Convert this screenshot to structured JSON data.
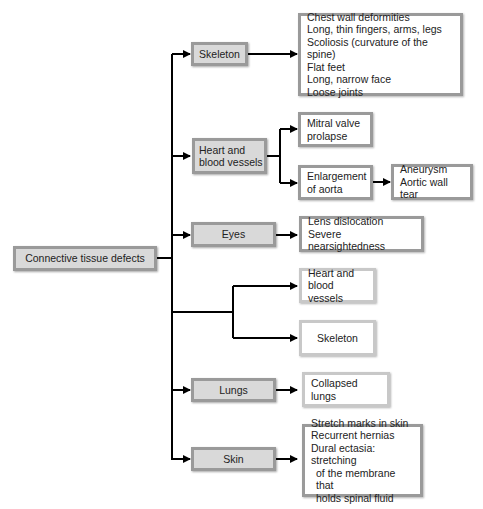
{
  "root": {
    "label": "Connective tissue defects"
  },
  "categories": [
    {
      "label": "Skeleton",
      "details": [
        "Chest wall deformities",
        "Long, thin fingers, arms, legs",
        "Scoliosis (curvature of the spine)",
        "Flat feet",
        "Long, narrow face",
        "Loose joints"
      ]
    },
    {
      "label": "Heart and blood vessels",
      "line1": "Heart and",
      "line2": "blood vessels",
      "sub": [
        {
          "line1": "Mitral valve",
          "line2": "prolapse"
        },
        {
          "line1": "Enlargement",
          "line2": "of aorta",
          "result": [
            "Aneurysm",
            "Aortic wall tear"
          ]
        }
      ]
    },
    {
      "label": "Eyes",
      "details": [
        "Lens dislocation",
        "Severe nearsightedness"
      ]
    },
    {
      "label": "",
      "targets": [
        {
          "line1": "Heart and",
          "line2": "blood vessels"
        },
        {
          "label": "Skeleton"
        }
      ]
    },
    {
      "label": "Lungs",
      "details": [
        "Collapsed lungs"
      ]
    },
    {
      "label": "Skin",
      "details": [
        "Stretch marks in skin",
        "Recurrent hernias",
        "Dural ectasia: stretching",
        "of the membrane that",
        "holds spinal fluid"
      ]
    }
  ],
  "colors": {
    "category_fill": "#d9d9d9",
    "border": "#9a9a9a",
    "light_border": "#c8c8c8",
    "line": "#000000"
  }
}
